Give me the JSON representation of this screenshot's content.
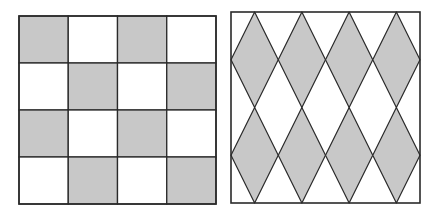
{
  "figures": [
    {
      "id": "checkerboard",
      "type": "square-grid",
      "rows": 4,
      "cols": 4,
      "shaded_pattern": [
        [
          1,
          0,
          1,
          0
        ],
        [
          0,
          1,
          0,
          1
        ],
        [
          1,
          0,
          1,
          0
        ],
        [
          0,
          1,
          0,
          1
        ]
      ],
      "bounds": {
        "x": 19,
        "y": 16,
        "w": 197,
        "h": 188
      }
    },
    {
      "id": "diamond-pattern",
      "type": "diamond-grid",
      "rows": 2,
      "cols": 4,
      "bounds": {
        "x": 231,
        "y": 12,
        "w": 189,
        "h": 191
      }
    }
  ],
  "colors": {
    "shade": "#c8c8c8",
    "line": "#2a2a2a",
    "background": "#ffffff"
  }
}
